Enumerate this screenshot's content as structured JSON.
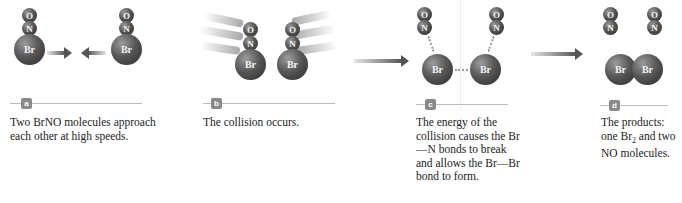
{
  "figure": {
    "atoms": {
      "oxygen": "O",
      "nitrogen": "N",
      "bromine": "Br"
    },
    "colors": {
      "atom": "#4a4a4a",
      "arrow": "#555555",
      "badge": "#8a8a8a",
      "label_line": "#bbbbbb"
    },
    "panels": [
      {
        "badge": "a",
        "caption": "Two BrNO molecules approach each other at high speeds."
      },
      {
        "badge": "b",
        "caption": "The collision occurs."
      },
      {
        "badge": "c",
        "caption": "The energy of the collision causes the Br—N bonds to break and allows the Br—Br bond to form."
      },
      {
        "badge": "d",
        "caption_pre": "The products: one Br",
        "caption_sub": "2",
        "caption_post": " and two NO molecules."
      }
    ]
  }
}
